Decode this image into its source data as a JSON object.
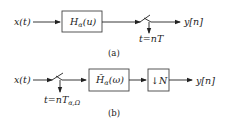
{
  "diagram_a": {
    "input_label": "x(t)",
    "filter_label_main": "H",
    "filter_label_sub": "α",
    "filter_label_arg": "(u)",
    "sampler_label": "t=nT",
    "output_label": "y[n]",
    "caption": "(a)"
  },
  "diagram_b": {
    "input_label": "x(t)",
    "sampler_label_main": "t=nT",
    "sampler_label_sub": "α,Ω",
    "filter_label_main": "H̃",
    "filter_label_sub": "α",
    "filter_label_arg": "(ω)",
    "downsampler_label": "↓N",
    "output_label": "y[n]",
    "caption": "(b)"
  }
}
